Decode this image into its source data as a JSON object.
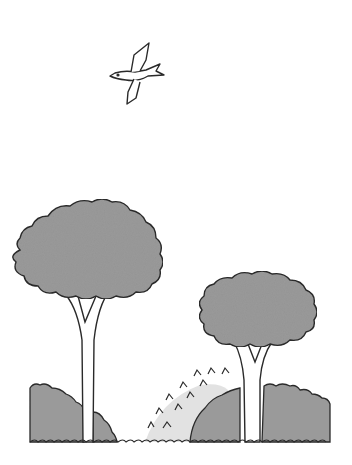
{
  "scene": {
    "description": "Line illustration of a bird flying over two trees with bushes",
    "colors": {
      "background": "#ffffff",
      "foliage": "#9a9a9a",
      "foliage_light": "#dcdcdc",
      "outline": "#2a2a2a"
    },
    "elements": [
      "bird",
      "tall-tree",
      "short-tree",
      "left-bush",
      "middle-spiky-bush",
      "right-bush",
      "ground-line"
    ]
  }
}
